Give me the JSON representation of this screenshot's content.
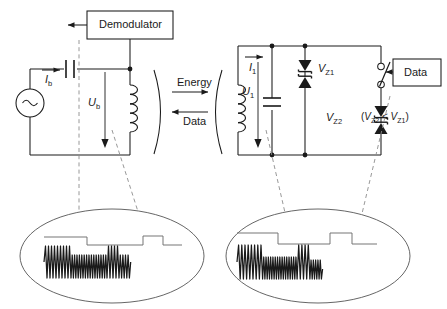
{
  "figure": {
    "background_color": "#ffffff",
    "line_color": "#1a1a1a",
    "dashed_color": "#808080",
    "width": 447,
    "height": 309
  },
  "primary_side": {
    "name": "Base station / primary circuit",
    "blocks": [
      {
        "id": "demodulator",
        "label": "Demodulator"
      }
    ],
    "components": [
      {
        "id": "ac-source",
        "type": "ac-voltage-source",
        "symbol": "~"
      },
      {
        "id": "series-capacitor",
        "type": "capacitor"
      },
      {
        "id": "primary-coil",
        "type": "inductor",
        "turns": 5
      }
    ],
    "labels": {
      "current": "I",
      "current_subscript": "b",
      "voltage": "U",
      "voltage_subscript": "b"
    }
  },
  "coupling": {
    "name": "Inductive coupling gap",
    "arrows": [
      {
        "id": "energy",
        "label": "Energy",
        "direction": "right"
      },
      {
        "id": "data",
        "label": "Data",
        "direction": "left"
      }
    ]
  },
  "secondary_side": {
    "name": "Transponder / secondary circuit",
    "blocks": [
      {
        "id": "data",
        "label": "Data"
      }
    ],
    "components": [
      {
        "id": "secondary-coil",
        "type": "inductor",
        "turns": 5
      },
      {
        "id": "shunt-capacitor",
        "type": "capacitor"
      },
      {
        "id": "zener-pair-1",
        "type": "anti-series-zener-pair"
      },
      {
        "id": "zener-pair-2",
        "type": "anti-series-zener-pair"
      },
      {
        "id": "modulation-switch",
        "type": "spst-switch",
        "state": "open"
      }
    ],
    "labels": {
      "current": "I",
      "current_subscript": "1",
      "voltage": "U",
      "voltage_subscript": "1",
      "zener1": "V",
      "zener1_subscript": "Z1",
      "zener2": "V",
      "zener2_subscript": "Z2"
    },
    "note": {
      "open_paren": "(",
      "left_symbol": "V",
      "left_subscript": "Z2",
      "relation": " < ",
      "right_symbol": "V",
      "right_subscript": "Z1",
      "close_paren": ")"
    }
  },
  "callouts": [
    {
      "id": "primary-waveform",
      "name": "Primary side magnified waveform",
      "envelope_levels": [
        1,
        0,
        1,
        0
      ],
      "envelope_breaks": [
        0.4,
        0.74,
        0.86
      ],
      "carrier_segments": [
        {
          "cycles": 9,
          "amplitude": 1.0
        },
        {
          "cycles": 15,
          "amplitude": 0.72
        },
        {
          "cycles": 4,
          "amplitude": 1.0
        },
        {
          "cycles": 4,
          "amplitude": 0.72
        }
      ]
    },
    {
      "id": "secondary-waveform",
      "name": "Secondary side magnified waveform",
      "envelope_levels": [
        1,
        0,
        1,
        0
      ],
      "envelope_breaks": [
        0.36,
        0.7,
        0.84
      ],
      "carrier_segments": [
        {
          "cycles": 8,
          "amplitude": 1.0
        },
        {
          "cycles": 15,
          "amplitude": 0.66
        },
        {
          "cycles": 4,
          "amplitude": 1.0
        },
        {
          "cycles": 5,
          "amplitude": 0.6
        }
      ]
    }
  ]
}
